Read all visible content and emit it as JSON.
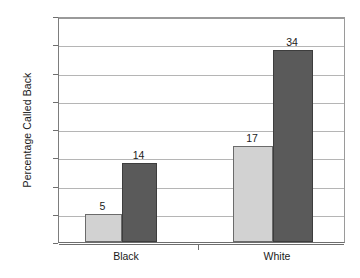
{
  "chart_data": {
    "type": "bar",
    "title": "",
    "xlabel": "",
    "ylabel": "Percentage Called Back",
    "categories": [
      "Black",
      "White"
    ],
    "series": [
      {
        "name": "light-bar",
        "values": [
          5,
          17
        ],
        "color": "#d2d2d2"
      },
      {
        "name": "dark-bar",
        "values": [
          14,
          34
        ],
        "color": "#5a5a5a"
      }
    ],
    "ylim": [
      0,
      40
    ],
    "yticks": [
      0,
      5,
      10,
      15,
      20,
      25,
      30,
      35,
      40
    ],
    "ytick_labels": [
      "0",
      "5",
      "10",
      "15",
      "20",
      "25",
      "30",
      "35",
      "40"
    ],
    "grid": true,
    "legend": "none",
    "data_labels": [
      "5",
      "14",
      "17",
      "34"
    ]
  },
  "axis": {
    "y_title": "Percentage Called Back",
    "ticks": [
      {
        "value": "40"
      },
      {
        "value": "35"
      },
      {
        "value": "30"
      },
      {
        "value": "25"
      },
      {
        "value": "20"
      },
      {
        "value": "15"
      },
      {
        "value": "10"
      },
      {
        "value": "5"
      },
      {
        "value": "0"
      }
    ]
  },
  "groups": [
    {
      "label": "Black",
      "bars": [
        {
          "name": "black-light-bar",
          "value": "5",
          "tone": "light"
        },
        {
          "name": "black-dark-bar",
          "value": "14",
          "tone": "dark"
        }
      ]
    },
    {
      "label": "White",
      "bars": [
        {
          "name": "white-light-bar",
          "value": "17",
          "tone": "light"
        },
        {
          "name": "white-dark-bar",
          "value": "34",
          "tone": "dark"
        }
      ]
    }
  ],
  "colors": {
    "light_bar": "#d2d2d2",
    "dark_bar": "#5a5a5a",
    "gridline": "#b5b5b5",
    "axis": "#6e6e6e",
    "text": "#1a1a1a"
  }
}
